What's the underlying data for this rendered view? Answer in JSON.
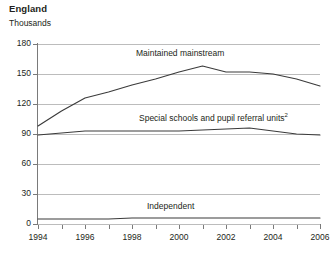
{
  "header": {
    "title": "England",
    "subtitle": "Thousands"
  },
  "chart_data": {
    "type": "line",
    "title": "England",
    "subtitle": "Thousands",
    "xlabel": "",
    "ylabel": "Thousands",
    "xlim": [
      1994,
      2006
    ],
    "ylim": [
      0,
      180
    ],
    "ytick_step": 30,
    "yticks": [
      180,
      150,
      120,
      90,
      60,
      30,
      0
    ],
    "xticks": [
      1994,
      1995,
      1996,
      1997,
      1998,
      1999,
      2000,
      2001,
      2002,
      2003,
      2004,
      2005,
      2006
    ],
    "xtick_labels": [
      "1994",
      "1996",
      "1998",
      "2000",
      "2002",
      "2004",
      "2006"
    ],
    "xtick_labels_years": [
      1994,
      1996,
      1998,
      2000,
      2002,
      2004,
      2006
    ],
    "grid": "horizontal",
    "legend": "inline-labels",
    "x": [
      1994,
      1995,
      1996,
      1997,
      1998,
      1999,
      2000,
      2001,
      2002,
      2003,
      2004,
      2005,
      2006
    ],
    "series": [
      {
        "name": "Maintained mainstream",
        "label": "Maintained mainstream",
        "color": "#3b3b3b",
        "values": [
          98,
          113,
          126,
          132,
          139,
          145,
          152,
          158,
          152,
          152,
          150,
          145,
          138
        ]
      },
      {
        "name": "Special schools and pupil referral units",
        "label": "Special schools and pupil referral units",
        "footnote_marker": "2",
        "color": "#3b3b3b",
        "values": [
          89,
          91,
          93,
          93,
          93,
          93,
          93,
          94,
          95,
          96,
          93,
          90,
          89
        ]
      },
      {
        "name": "Independent",
        "label": "Independent",
        "color": "#3b3b3b",
        "values": [
          5,
          5,
          5,
          5,
          6,
          6,
          6,
          6,
          6,
          6,
          6,
          6,
          6
        ]
      }
    ]
  }
}
